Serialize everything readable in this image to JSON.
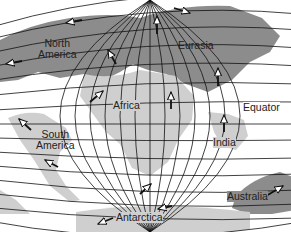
{
  "colors": {
    "background": "#ffffff",
    "land_dark": "#8c8c8c",
    "land_light": "#cfcfcf",
    "grid": "#111111",
    "arrow": "#111111",
    "text": "#222222"
  },
  "labels": {
    "north_america_line1": "North",
    "north_america_line2": "America",
    "eurasia": "Eurasia",
    "africa": "Africa",
    "equator": "Equator",
    "india": "India",
    "south_america_line1": "South",
    "south_america_line2": "America",
    "australia": "Australia",
    "antarctica": "Antarctica"
  },
  "arrows": [
    {
      "plate": "north-america-north",
      "x": 70,
      "y": 22,
      "direction": "west"
    },
    {
      "plate": "north-america-west",
      "x": 12,
      "y": 63,
      "direction": "west"
    },
    {
      "plate": "north-america-east",
      "x": 112,
      "y": 55,
      "direction": "north-west"
    },
    {
      "plate": "eurasia-north",
      "x": 182,
      "y": 10,
      "direction": "east"
    },
    {
      "plate": "eurasia-west",
      "x": 156,
      "y": 28,
      "direction": "north"
    },
    {
      "plate": "eurasia-south",
      "x": 218,
      "y": 77,
      "direction": "north"
    },
    {
      "plate": "africa-west",
      "x": 98,
      "y": 95,
      "direction": "north-east"
    },
    {
      "plate": "africa-east",
      "x": 170,
      "y": 97,
      "direction": "north"
    },
    {
      "plate": "india",
      "x": 224,
      "y": 124,
      "direction": "north"
    },
    {
      "plate": "south-america-north",
      "x": 22,
      "y": 125,
      "direction": "north-west"
    },
    {
      "plate": "south-america-south",
      "x": 50,
      "y": 163,
      "direction": "north-west"
    },
    {
      "plate": "atlantic",
      "x": 146,
      "y": 188,
      "direction": "north-east"
    },
    {
      "plate": "antarctica-west",
      "x": 102,
      "y": 222,
      "direction": "west"
    },
    {
      "plate": "antarctica-east",
      "x": 160,
      "y": 210,
      "direction": "west"
    },
    {
      "plate": "australia",
      "x": 279,
      "y": 188,
      "direction": "north-east"
    }
  ]
}
